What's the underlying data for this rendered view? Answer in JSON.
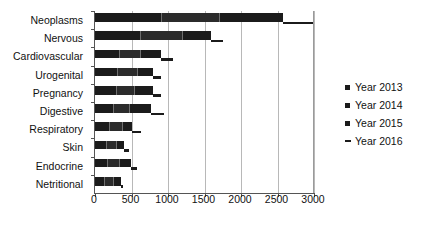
{
  "chart_data": {
    "type": "bar",
    "orientation": "horizontal",
    "stacked": true,
    "title": "",
    "xlabel": "",
    "ylabel": "",
    "xlim": [
      0,
      3000
    ],
    "xticks": [
      0,
      500,
      1000,
      1500,
      2000,
      2500,
      3000
    ],
    "xtick_labels": [
      "0",
      "500",
      "1000",
      "1500",
      "2000",
      "2500",
      "3000"
    ],
    "grid": true,
    "legend_position": "right",
    "categories": [
      "Neoplasms",
      "Nervous",
      "Cardiovascular",
      "Urogenital",
      "Pregnancy",
      "Digestive",
      "Respiratory",
      "Skin",
      "Endocrine",
      "Netritional"
    ],
    "series": [
      {
        "name": "Year 2013",
        "marker": "square",
        "values": [
          900,
          620,
          330,
          300,
          290,
          250,
          190,
          150,
          170,
          130
        ]
      },
      {
        "name": "Year 2014",
        "marker": "square",
        "values": [
          800,
          570,
          290,
          270,
          250,
          220,
          175,
          140,
          160,
          120
        ]
      },
      {
        "name": "Year 2015",
        "marker": "square",
        "values": [
          880,
          400,
          280,
          220,
          250,
          300,
          140,
          110,
          160,
          100
        ]
      },
      {
        "name": "Year 2016",
        "marker": "dash",
        "values": [
          400,
          170,
          170,
          110,
          110,
          170,
          130,
          70,
          80,
          40
        ]
      }
    ],
    "totals": [
      2980,
      1760,
      1070,
      900,
      900,
      940,
      635,
      470,
      570,
      390
    ]
  },
  "legend": {
    "items": [
      {
        "label": "Year 2013",
        "marker": "square"
      },
      {
        "label": "Year 2014",
        "marker": "square"
      },
      {
        "label": "Year 2015",
        "marker": "square"
      },
      {
        "label": "Year 2016",
        "marker": "dash"
      }
    ]
  },
  "colors": {
    "series_2013": "#1b1b1b",
    "series_2014": "#2b2b2b",
    "series_2015": "#1b1b1b",
    "series_2016": "#1b1b1b",
    "axis": "#555555",
    "grid": "#b8b8b8",
    "background": "#ffffff"
  }
}
